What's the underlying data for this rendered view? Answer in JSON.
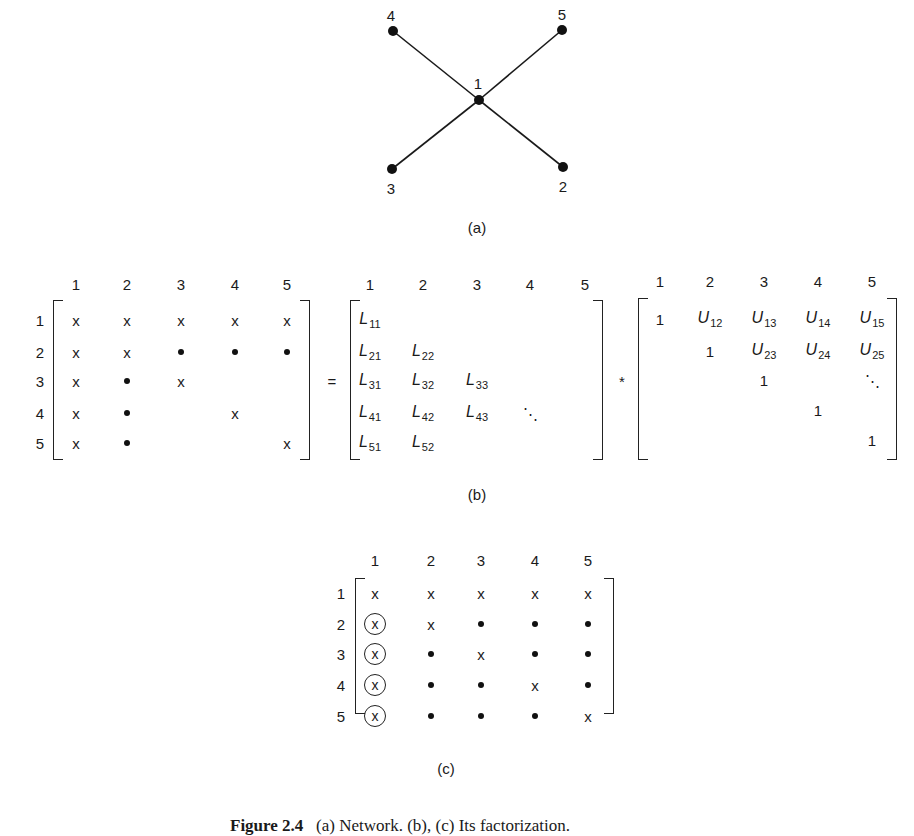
{
  "figure": {
    "caption_label": "Figure 2.4",
    "caption_text": "(a) Network. (b), (c) Its factorization."
  },
  "part_a": {
    "label": "(a)",
    "nodes": [
      {
        "id": "1",
        "x": 479,
        "y": 100
      },
      {
        "id": "2",
        "x": 563,
        "y": 167
      },
      {
        "id": "3",
        "x": 392,
        "y": 169
      },
      {
        "id": "4",
        "x": 393,
        "y": 31
      },
      {
        "id": "5",
        "x": 562,
        "y": 30
      }
    ],
    "edges": [
      [
        "1",
        "2"
      ],
      [
        "1",
        "3"
      ],
      [
        "1",
        "4"
      ],
      [
        "1",
        "5"
      ]
    ]
  },
  "part_b": {
    "label": "(b)",
    "equals": "=",
    "times": "*",
    "A": {
      "col_headers": [
        "1",
        "2",
        "3",
        "4",
        "5"
      ],
      "row_headers": [
        "1",
        "2",
        "3",
        "4",
        "5"
      ],
      "cells": [
        [
          "x",
          "x",
          "x",
          "x",
          "x"
        ],
        [
          "x",
          "x",
          "•",
          "•",
          "•"
        ],
        [
          "x",
          "•",
          "x",
          "",
          ""
        ],
        [
          "x",
          "•",
          "",
          "x",
          ""
        ],
        [
          "x",
          "•",
          "",
          "",
          "x"
        ]
      ]
    },
    "L": {
      "col_headers": [
        "1",
        "2",
        "3",
        "4",
        "5"
      ],
      "cells": [
        [
          "L11",
          "",
          "",
          "",
          ""
        ],
        [
          "L21",
          "L22",
          "",
          "",
          ""
        ],
        [
          "L31",
          "L32",
          "L33",
          "",
          ""
        ],
        [
          "L41",
          "L42",
          "L43",
          "⋱",
          ""
        ],
        [
          "L51",
          "L52",
          "",
          "",
          ""
        ]
      ]
    },
    "U": {
      "col_headers": [
        "1",
        "2",
        "3",
        "4",
        "5"
      ],
      "cells": [
        [
          "1",
          "U12",
          "U13",
          "U14",
          "U15"
        ],
        [
          "",
          "1",
          "U23",
          "U24",
          "U25"
        ],
        [
          "",
          "",
          "1",
          "",
          "⋱"
        ],
        [
          "",
          "",
          "",
          "1",
          ""
        ],
        [
          "",
          "",
          "",
          "",
          "1"
        ]
      ]
    }
  },
  "part_c": {
    "label": "(c)",
    "col_headers": [
      "1",
      "2",
      "3",
      "4",
      "5"
    ],
    "row_headers": [
      "1",
      "2",
      "3",
      "4",
      "5"
    ],
    "cells": [
      [
        "x",
        "x",
        "x",
        "x",
        "x"
      ],
      [
        "(x)",
        "x",
        "•",
        "•",
        "•"
      ],
      [
        "(x)",
        "•",
        "x",
        "•",
        "•"
      ],
      [
        "(x)",
        "•",
        "•",
        "x",
        "•"
      ],
      [
        "(x)",
        "•",
        "•",
        "•",
        "x"
      ]
    ]
  }
}
